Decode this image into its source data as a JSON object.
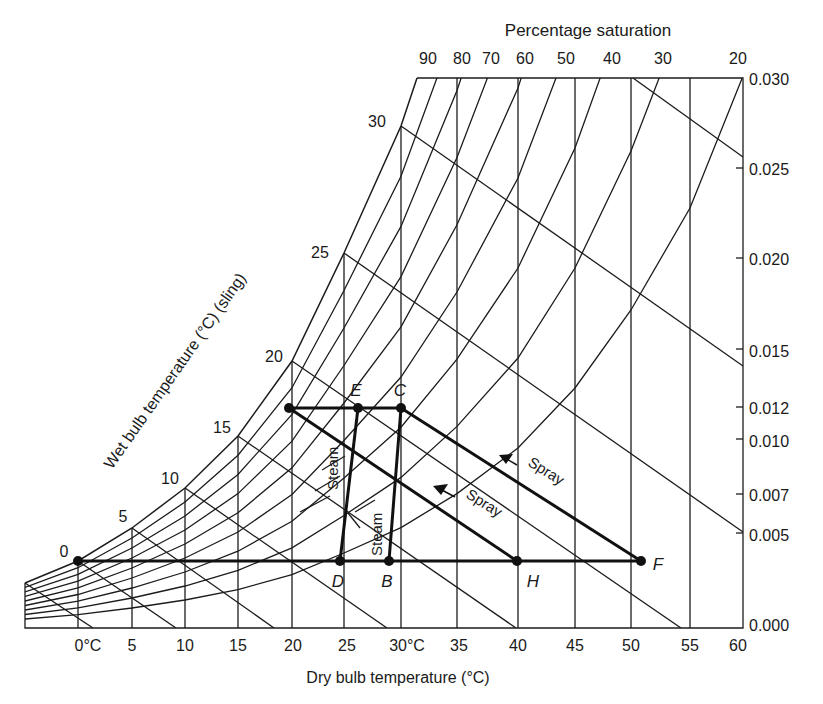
{
  "chart_data": {
    "type": "psychrometric",
    "title": "Percentage saturation",
    "xlabel": "Dry bulb temperature (°C)",
    "ylabel_right": "Moisture content (kg/kg)",
    "wetbulb_label": "Wet bulb temperature (°C) (sling)",
    "x_ticks": [
      "0°C",
      "5",
      "10",
      "15",
      "20",
      "25",
      "30°C",
      "35",
      "40",
      "45",
      "50",
      "55",
      "60"
    ],
    "x_tick_values": [
      0,
      5,
      10,
      15,
      20,
      25,
      30,
      35,
      40,
      45,
      50,
      55,
      60
    ],
    "y_ticks": [
      "0.030",
      "0.025",
      "0.020",
      "0.015",
      "0.012",
      "0.010",
      "0.007",
      "0.005",
      "0.000"
    ],
    "y_tick_values": [
      0.03,
      0.025,
      0.02,
      0.015,
      0.012,
      0.01,
      0.007,
      0.005,
      0.0
    ],
    "saturation_ticks": [
      "90",
      "80",
      "70",
      "60",
      "50",
      "40",
      "30",
      "20"
    ],
    "wetbulb_ticks": [
      "0",
      "5",
      "10",
      "15",
      "20",
      "25",
      "30"
    ],
    "xlim": [
      -5,
      60
    ],
    "ylim": [
      0.0,
      0.03
    ],
    "points": [
      {
        "label": "",
        "dry_bulb": 20,
        "moisture": 0.012
      },
      {
        "label": "E",
        "dry_bulb": 26,
        "moisture": 0.012
      },
      {
        "label": "C",
        "dry_bulb": 30,
        "moisture": 0.012
      },
      {
        "label": "",
        "dry_bulb": 0,
        "moisture": 0.0037
      },
      {
        "label": "D",
        "dry_bulb": 24.5,
        "moisture": 0.0037
      },
      {
        "label": "B",
        "dry_bulb": 28.5,
        "moisture": 0.0037
      },
      {
        "label": "H",
        "dry_bulb": 40,
        "moisture": 0.0037
      },
      {
        "label": "F",
        "dry_bulb": 51,
        "moisture": 0.0037
      }
    ],
    "processes": [
      {
        "from": "D",
        "to": "E",
        "label": "Steam"
      },
      {
        "from": "B",
        "to": "C",
        "label": "Steam"
      },
      {
        "from": "H",
        "to": "20°C sat",
        "label": "Spray"
      },
      {
        "from": "F",
        "to": "C",
        "label": "Spray"
      }
    ]
  },
  "labels": {
    "title": "Percentage saturation",
    "xlabel": "Dry bulb temperature (°C)",
    "wetbulb": "Wet bulb temperature (°C) (sling)",
    "steam": "Steam",
    "spray": "Spray",
    "E": "E",
    "C": "C",
    "D": "D",
    "B": "B",
    "H": "H",
    "F": "F",
    "rh": [
      "90",
      "80",
      "70",
      "60",
      "50",
      "40",
      "30",
      "20"
    ],
    "wb": [
      "0",
      "5",
      "10",
      "15",
      "20",
      "25",
      "30"
    ],
    "x": [
      "0°C",
      "5",
      "10",
      "15",
      "20",
      "25",
      "30°C",
      "35",
      "40",
      "45",
      "50",
      "55",
      "60"
    ],
    "y": [
      "0.030",
      "0.025",
      "0.020",
      "0.015",
      "0.012",
      "0.010",
      "0.007",
      "0.005",
      "0.000"
    ]
  }
}
